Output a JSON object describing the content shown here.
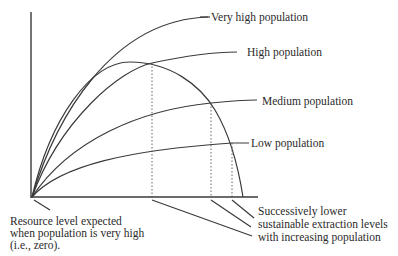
{
  "diagram": {
    "curves": {
      "very_high": "Very high population",
      "high": "High population",
      "medium": "Medium population",
      "low": "Low population"
    },
    "annotations": {
      "left": {
        "line1": "Resource level expected",
        "line2": "when population is very high",
        "line3": "(i.e., zero)."
      },
      "right": {
        "line1": "Successively lower",
        "line2": "sustainable extraction levels",
        "line3": "with increasing population"
      }
    }
  }
}
